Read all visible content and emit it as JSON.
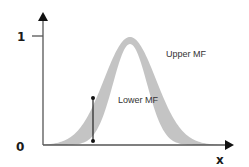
{
  "diagram": {
    "title": "",
    "type": "interval type-2 fuzzy membership function",
    "axes": {
      "x_label": "x",
      "y_tick_top": "1",
      "y_tick_bottom": "0"
    },
    "labels": {
      "upper_mf": "Upper MF",
      "lower_mf": "Lower MF"
    },
    "colors": {
      "axis": "#555555",
      "band_fill": "#c4c4c4",
      "interval_line": "#222222",
      "text": "#1a1a1a"
    },
    "upper_mf": {
      "center_px": 130,
      "peak_y_px": 37,
      "sigma_px": 26
    },
    "lower_mf": {
      "center_px": 130,
      "peak_y_px": 44,
      "sigma_px": 17
    },
    "interval_marker": {
      "x_px": 93,
      "top_y_px": 97,
      "bottom_y_px": 141
    }
  }
}
